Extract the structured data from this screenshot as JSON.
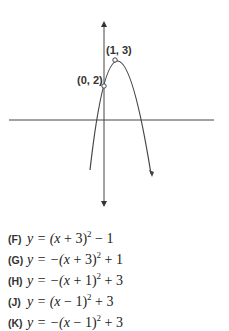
{
  "graph": {
    "points": [
      {
        "label": "(1, 3)",
        "x": 1,
        "y": 3,
        "role": "vertex"
      },
      {
        "label": "(0, 2)",
        "x": 0,
        "y": 2,
        "role": "y-intercept"
      }
    ],
    "curve": "downward-opening parabola",
    "axes": {
      "x_axis": "horizontal line",
      "y_axis": "vertical line with arrows at both ends"
    }
  },
  "choices": [
    {
      "letter": "(F)",
      "pre": "y = (",
      "var": "x",
      "mid": " + 3)",
      "exp": "2",
      "post": " − 1",
      "sign": ""
    },
    {
      "letter": "(G)",
      "pre": "y = −(",
      "var": "x",
      "mid": " + 3)",
      "exp": "2",
      "post": " + 1"
    },
    {
      "letter": "(H)",
      "pre": "y = −(",
      "var": "x",
      "mid": " + 1)",
      "exp": "2",
      "post": " + 3"
    },
    {
      "letter": "(J)",
      "pre": "y = (",
      "var": "x",
      "mid": " − 1)",
      "exp": "2",
      "post": " + 3"
    },
    {
      "letter": "(K)",
      "pre": "y = −(",
      "var": "x",
      "mid": " − 1)",
      "exp": "2",
      "post": " + 3"
    }
  ]
}
